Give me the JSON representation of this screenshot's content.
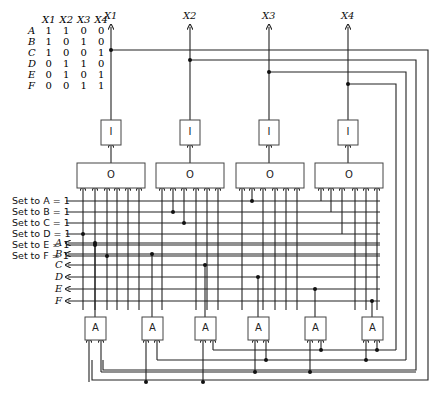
{
  "truth_table": {
    "headers": [
      "X1",
      "X2",
      "X3",
      "X4"
    ],
    "rows": [
      {
        "label": "A",
        "values": [
          "1",
          "1",
          "0",
          "0"
        ]
      },
      {
        "label": "B",
        "values": [
          "1",
          "0",
          "1",
          "0"
        ]
      },
      {
        "label": "C",
        "values": [
          "1",
          "0",
          "0",
          "1"
        ]
      },
      {
        "label": "D",
        "values": [
          "0",
          "1",
          "1",
          "0"
        ]
      },
      {
        "label": "E",
        "values": [
          "0",
          "1",
          "0",
          "1"
        ]
      },
      {
        "label": "F",
        "values": [
          "0",
          "0",
          "1",
          "1"
        ]
      }
    ]
  },
  "outputs": [
    "X1",
    "X2",
    "X3",
    "X4"
  ],
  "set_inputs": [
    "Set to A = 1",
    "Set to B = 1",
    "Set to C = 1",
    "Set to D = 1",
    "Set to E = 1",
    "Set to F = 1"
  ],
  "state_outputs": [
    "A",
    "B",
    "C",
    "D",
    "E",
    "F"
  ],
  "gates": {
    "inverter_label": "I",
    "or_label": "O",
    "and_label": "A"
  }
}
